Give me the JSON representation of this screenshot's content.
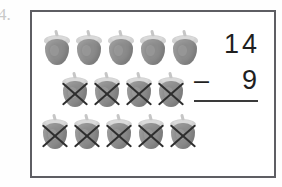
{
  "worksheet": {
    "problem_number": "4.",
    "border_color": "#5e5e63",
    "page_background": "#ffffff"
  },
  "equation": {
    "minuend": "14",
    "operator": "–",
    "subtrahend": "9",
    "answer": "",
    "rule_color": "#3a3a3a"
  },
  "counters": {
    "icon_name": "strawberry-icon",
    "cross_icon_name": "cross-out-x-icon",
    "body_color": "#8b8b8b",
    "leaf_color": "#cfcfcf",
    "cross_color": "#2e2e2e",
    "total": 14,
    "crossed_out": 9,
    "remaining": 5,
    "rows": [
      {
        "count": 5,
        "crossed": [
          false,
          false,
          false,
          false,
          false
        ]
      },
      {
        "count": 4,
        "crossed": [
          true,
          true,
          true,
          true
        ]
      },
      {
        "count": 5,
        "crossed": [
          true,
          true,
          true,
          true,
          true
        ]
      }
    ]
  },
  "chart_data": {
    "type": "bar",
    "title": "14 - 9",
    "categories": [
      "Row 1",
      "Row 2",
      "Row 3"
    ],
    "series": [
      {
        "name": "Strawberries shown",
        "values": [
          5,
          4,
          5
        ]
      },
      {
        "name": "Crossed out",
        "values": [
          0,
          4,
          5
        ]
      }
    ],
    "xlabel": "",
    "ylabel": "",
    "ylim": [
      0,
      5
    ]
  }
}
